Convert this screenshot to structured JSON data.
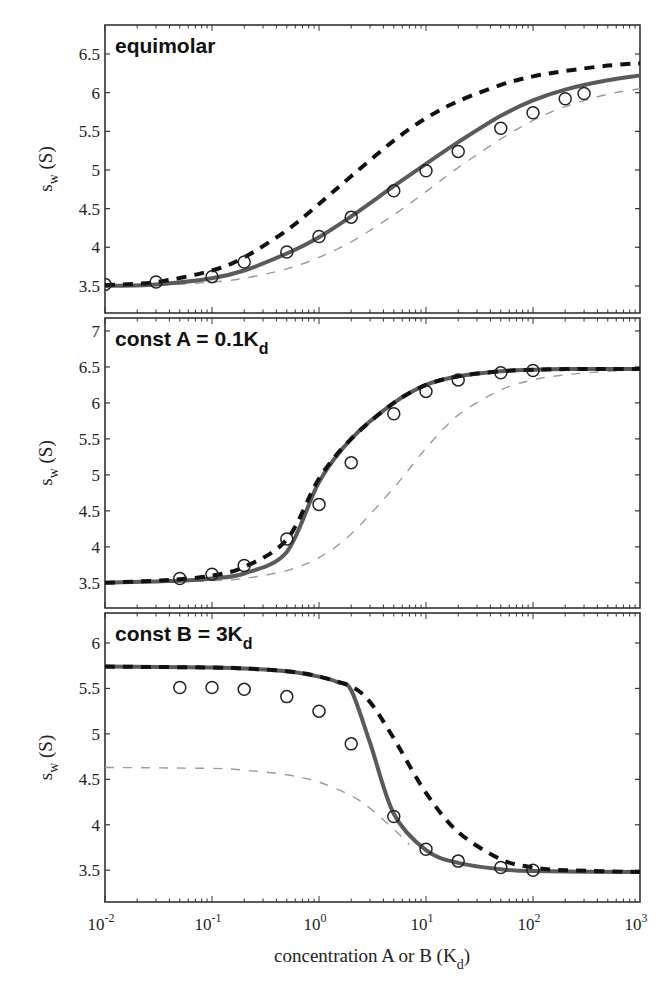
{
  "figure": {
    "xlabel": "concentration A or B (K",
    "xlabel_sub": "d",
    "xlabel_end": ")",
    "ylabel": "s",
    "ylabel_sub": "w",
    "ylabel_unit": " (S)",
    "x_ticks": [
      {
        "base": "10",
        "exp": "-2",
        "value": 0.01
      },
      {
        "base": "10",
        "exp": "-1",
        "value": 0.1
      },
      {
        "base": "10",
        "exp": "0",
        "value": 1
      },
      {
        "base": "10",
        "exp": "1",
        "value": 10
      },
      {
        "base": "10",
        "exp": "2",
        "value": 100
      },
      {
        "base": "10",
        "exp": "3",
        "value": 1000
      }
    ],
    "colors": {
      "solid": "#5a5a5a",
      "thick_dashed": "#111111",
      "thin_dashed": "#9a9a9a",
      "markers": "#222222",
      "axes": "#333333"
    }
  },
  "chart_data": [
    {
      "type": "line",
      "title": "equimolar",
      "title_sub": "",
      "xscale": "log",
      "xlim": [
        0.01,
        1000
      ],
      "ylim": [
        3.15,
        6.875
      ],
      "yticks": [
        3.5,
        4,
        4.5,
        5,
        5.5,
        6,
        6.5
      ],
      "ytick_labels": [
        "3.5",
        "4",
        "4.5",
        "5",
        "5.5",
        "6",
        "6.5"
      ],
      "xlabel": "",
      "ylabel": "s_w (S)",
      "series": [
        {
          "name": "solid fit",
          "style": "solid",
          "x": [
            0.01,
            0.03,
            0.1,
            0.2,
            0.5,
            1,
            2,
            5,
            10,
            20,
            50,
            100,
            200,
            500,
            1000
          ],
          "y": [
            3.5,
            3.52,
            3.6,
            3.7,
            3.92,
            4.13,
            4.4,
            4.79,
            5.08,
            5.36,
            5.7,
            5.9,
            6.04,
            6.16,
            6.22
          ]
        },
        {
          "name": "thick dashed",
          "style": "thick-dashed",
          "x": [
            0.01,
            0.03,
            0.1,
            0.2,
            0.5,
            1,
            2,
            5,
            10,
            20,
            50,
            100,
            200,
            500,
            1000
          ],
          "y": [
            3.51,
            3.55,
            3.7,
            3.87,
            4.22,
            4.56,
            4.92,
            5.38,
            5.67,
            5.89,
            6.1,
            6.21,
            6.28,
            6.35,
            6.38
          ]
        },
        {
          "name": "thin dashed",
          "style": "thin-dashed",
          "x": [
            0.01,
            0.03,
            0.1,
            0.2,
            0.5,
            1,
            2,
            5,
            10,
            20,
            50,
            100,
            200,
            500,
            1000
          ],
          "y": [
            3.5,
            3.51,
            3.55,
            3.6,
            3.72,
            3.87,
            4.07,
            4.42,
            4.72,
            5.03,
            5.4,
            5.64,
            5.82,
            5.98,
            6.05
          ]
        },
        {
          "name": "data",
          "style": "markers",
          "x": [
            0.01,
            0.03,
            0.1,
            0.2,
            0.5,
            1,
            2,
            5,
            10,
            20,
            50,
            100,
            200,
            300
          ],
          "y": [
            3.52,
            3.55,
            3.62,
            3.81,
            3.94,
            4.14,
            4.39,
            4.73,
            4.99,
            5.24,
            5.54,
            5.74,
            5.92,
            5.99
          ]
        }
      ]
    },
    {
      "type": "line",
      "title": "const A = 0.1K",
      "title_sub": "d",
      "xscale": "log",
      "xlim": [
        0.01,
        1000
      ],
      "ylim": [
        3.15,
        7.18
      ],
      "yticks": [
        3.5,
        4,
        4.5,
        5,
        5.5,
        6,
        6.5,
        7
      ],
      "ytick_labels": [
        "3.5",
        "4",
        "4.5",
        "5",
        "5.5",
        "6",
        "6.5",
        "7"
      ],
      "xlabel": "",
      "ylabel": "s_w (S)",
      "series": [
        {
          "name": "solid fit",
          "style": "solid",
          "x": [
            0.01,
            0.03,
            0.05,
            0.1,
            0.2,
            0.5,
            1,
            2,
            5,
            10,
            20,
            50,
            100,
            200,
            500,
            1000
          ],
          "y": [
            3.5,
            3.52,
            3.53,
            3.56,
            3.63,
            3.93,
            4.9,
            5.5,
            6.0,
            6.25,
            6.37,
            6.44,
            6.46,
            6.47,
            6.47,
            6.47
          ]
        },
        {
          "name": "thick dashed",
          "style": "thick-dashed",
          "x": [
            0.01,
            0.03,
            0.05,
            0.1,
            0.2,
            0.5,
            1,
            2,
            5,
            10,
            20,
            50,
            100,
            200,
            500,
            1000
          ],
          "y": [
            3.5,
            3.53,
            3.55,
            3.6,
            3.72,
            4.1,
            4.95,
            5.5,
            6.0,
            6.25,
            6.37,
            6.44,
            6.46,
            6.47,
            6.47,
            6.47
          ]
        },
        {
          "name": "thin dashed",
          "style": "thin-dashed",
          "x": [
            0.01,
            0.03,
            0.1,
            0.2,
            0.5,
            1,
            2,
            5,
            10,
            20,
            50,
            100,
            200,
            500,
            1000
          ],
          "y": [
            3.5,
            3.51,
            3.53,
            3.56,
            3.67,
            3.85,
            4.18,
            4.82,
            5.37,
            5.83,
            6.18,
            6.32,
            6.39,
            6.44,
            6.46
          ]
        },
        {
          "name": "data",
          "style": "markers",
          "x": [
            0.05,
            0.1,
            0.2,
            0.5,
            1,
            2,
            5,
            10,
            20,
            50,
            100
          ],
          "y": [
            3.56,
            3.62,
            3.74,
            4.11,
            4.59,
            5.17,
            5.85,
            6.16,
            6.32,
            6.42,
            6.45
          ]
        }
      ]
    },
    {
      "type": "line",
      "title": "const B = 3K",
      "title_sub": "d",
      "xscale": "log",
      "xlim": [
        0.01,
        1000
      ],
      "ylim": [
        3.15,
        6.33
      ],
      "yticks": [
        3.5,
        4,
        4.5,
        5,
        5.5,
        6
      ],
      "ytick_labels": [
        "3.5",
        "4",
        "4.5",
        "5",
        "5.5",
        "6"
      ],
      "xlabel": "concentration A or B (K_d)",
      "ylabel": "s_w (S)",
      "series": [
        {
          "name": "solid fit",
          "style": "solid",
          "x": [
            0.01,
            0.1,
            0.2,
            0.5,
            1,
            1.5,
            2,
            3,
            5,
            10,
            20,
            50,
            100,
            1000
          ],
          "y": [
            5.74,
            5.73,
            5.72,
            5.69,
            5.63,
            5.57,
            5.48,
            4.9,
            4.12,
            3.72,
            3.58,
            3.51,
            3.49,
            3.48
          ]
        },
        {
          "name": "thick dashed",
          "style": "thick-dashed",
          "x": [
            0.01,
            0.1,
            0.2,
            0.5,
            1,
            2,
            3,
            5,
            10,
            20,
            50,
            100,
            200,
            1000
          ],
          "y": [
            5.74,
            5.73,
            5.72,
            5.69,
            5.63,
            5.52,
            5.35,
            4.95,
            4.35,
            3.92,
            3.62,
            3.53,
            3.5,
            3.48
          ]
        },
        {
          "name": "thin dashed",
          "style": "thin-dashed",
          "x": [
            0.01,
            0.1,
            0.2,
            0.5,
            1,
            2,
            3,
            5,
            7
          ],
          "y": [
            4.63,
            4.62,
            4.6,
            4.55,
            4.47,
            4.32,
            4.18,
            3.95,
            3.78
          ]
        },
        {
          "name": "data",
          "style": "markers",
          "x": [
            0.05,
            0.1,
            0.2,
            0.5,
            1,
            2,
            5,
            10,
            20,
            50,
            100
          ],
          "y": [
            5.51,
            5.51,
            5.49,
            5.41,
            5.25,
            4.89,
            4.09,
            3.73,
            3.6,
            3.53,
            3.5
          ]
        }
      ]
    }
  ],
  "layout": {
    "x_left": 105,
    "x_right": 640,
    "panels": [
      {
        "top": 25,
        "bottom": 313
      },
      {
        "top": 318,
        "bottom": 608
      },
      {
        "top": 613,
        "bottom": 902
      }
    ]
  }
}
